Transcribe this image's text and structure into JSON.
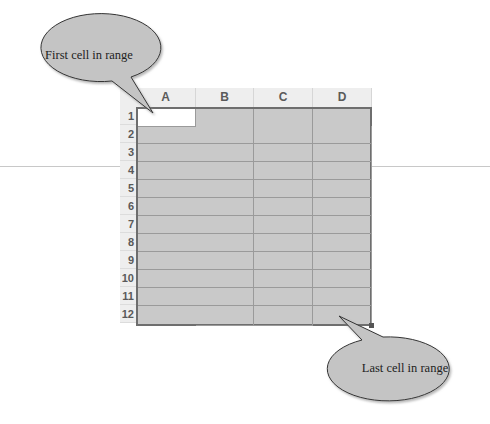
{
  "callouts": {
    "first": {
      "label": "First cell in range"
    },
    "last": {
      "label": "Last cell in range"
    }
  },
  "spreadsheet": {
    "columns": [
      "A",
      "B",
      "C",
      "D"
    ],
    "rows": [
      "1",
      "2",
      "3",
      "4",
      "5",
      "6",
      "7",
      "8",
      "9",
      "10",
      "11",
      "12"
    ],
    "selected_range": "A1:D12",
    "active_cell": "A1"
  },
  "colors": {
    "selection_fill": "#c9c9c9",
    "callout_fill": "#c4c4c4",
    "header_fill": "#eeeeee"
  }
}
